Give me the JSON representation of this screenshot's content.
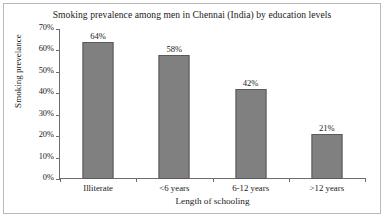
{
  "chart_data": {
    "type": "bar",
    "title": "Smoking prevalence among men in Chennai (India) by education levels",
    "xlabel": "Length of schooling",
    "ylabel": "Smoking prevelance",
    "categories": [
      "Illiterate",
      "<6 years",
      "6-12 years",
      ">12 years"
    ],
    "values": [
      64,
      58,
      42,
      21
    ],
    "data_labels": [
      "64%",
      "58%",
      "42%",
      "21%"
    ],
    "ylim": [
      0,
      70
    ],
    "ytick_values": [
      0,
      10,
      20,
      30,
      40,
      50,
      60,
      70
    ],
    "ytick_labels": [
      "0%",
      "10%",
      "20%",
      "30%",
      "40%",
      "50%",
      "60%",
      "70%"
    ],
    "grid": false,
    "legend": false,
    "bar_color": "#808080",
    "bar_edge_color": "#5a5a5a",
    "axis_color": "#6d6d6d",
    "text_color": "#1a1a1a",
    "frame_border_color": "#b9b9b9",
    "background": "#ffffff"
  }
}
